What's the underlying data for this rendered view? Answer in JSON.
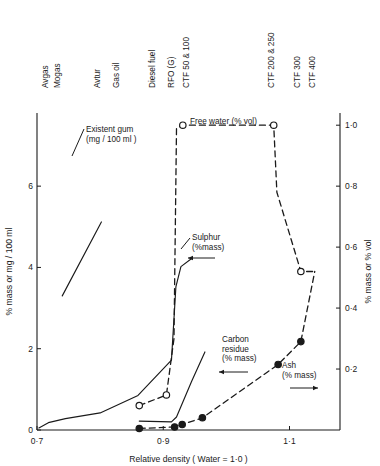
{
  "figure": {
    "title": "",
    "background": "#ffffff",
    "ink": "#1a1a1a"
  },
  "axes": {
    "x": {
      "label": "Relative density  ( Water = 1·0 )",
      "ticks": [
        "0·7",
        "0·9",
        "1·1"
      ],
      "tick_values": [
        0.7,
        0.9,
        1.1
      ],
      "min": 0.7,
      "max": 1.18
    },
    "y_left": {
      "label": "% mass  or  mg / 100 ml",
      "ticks": [
        "0",
        "2",
        "4",
        "6"
      ],
      "tick_values": [
        0,
        2,
        4,
        6
      ],
      "min": 0,
      "max": 7.8
    },
    "y_right": {
      "label": "% mass or % vol",
      "ticks": [
        "0·2",
        "0·4",
        "0·6",
        "0·8",
        "1·0"
      ],
      "tick_values": [
        0.2,
        0.4,
        0.6,
        0.8,
        1.0
      ],
      "min": 0,
      "max": 1.04
    }
  },
  "top_labels": [
    {
      "text": "Avgas",
      "density": 0.717
    },
    {
      "text": "Mogas",
      "density": 0.737
    },
    {
      "text": "Avtur",
      "density": 0.8
    },
    {
      "text": "Gas oil",
      "density": 0.83
    },
    {
      "text": "Diesel fuel",
      "density": 0.887
    },
    {
      "text": "RFO (G)",
      "density": 0.917
    },
    {
      "text": "CTF 50 & 100",
      "density": 0.94
    },
    {
      "text": "CTF 200 & 250",
      "density": 1.075
    },
    {
      "text": "CTF 300",
      "density": 1.116
    },
    {
      "text": "CTF 400",
      "density": 1.14
    }
  ],
  "annotations": [
    {
      "name": "existent-gum",
      "lines": [
        "Existent  gum",
        "(mg / 100 ml )"
      ],
      "arrow": "none"
    },
    {
      "name": "free-water",
      "lines": [
        "Free  water (% vol)"
      ],
      "arrow": "none"
    },
    {
      "name": "sulphur",
      "lines": [
        "Sulphur",
        "(%mass)"
      ],
      "arrow": "left"
    },
    {
      "name": "carbon-residue",
      "lines": [
        "Carbon",
        "residue",
        "(% mass)"
      ],
      "arrow": "left"
    },
    {
      "name": "ash",
      "lines": [
        "Ash",
        "(% mass)"
      ],
      "arrow": "right"
    }
  ],
  "chart_data": {
    "type": "line",
    "title": "",
    "xlabel": "Relative density  ( Water = 1·0 )",
    "ylabel": "% mass  or  mg / 100 ml",
    "ylabel_right": "% mass or % vol",
    "xlim": [
      0.7,
      1.18
    ],
    "ylim_left": [
      0,
      7.8
    ],
    "ylim_right": [
      0,
      1.04
    ],
    "grid": false,
    "legend": "inline-annotations",
    "series": [
      {
        "name": "Existent gum (mg/100 ml)",
        "axis": "left",
        "style": "solid",
        "marker": "none",
        "points": [
          {
            "x": 0.74,
            "y": 3.3
          },
          {
            "x": 0.8,
            "y": 5.1
          },
          {
            "x": 0.79,
            "y": 4.85
          }
        ],
        "points_full": [
          {
            "x": 0.74,
            "y": 3.3
          },
          {
            "x": 0.802,
            "y": 5.12
          }
        ]
      },
      {
        "name": "Sulphur (% mass)",
        "axis": "left",
        "style": "solid",
        "marker": "none",
        "points": [
          {
            "x": 0.703,
            "y": 0.05
          },
          {
            "x": 0.718,
            "y": 0.18
          },
          {
            "x": 0.745,
            "y": 0.28
          },
          {
            "x": 0.8,
            "y": 0.42
          },
          {
            "x": 0.86,
            "y": 0.85
          },
          {
            "x": 0.913,
            "y": 1.72
          },
          {
            "x": 0.92,
            "y": 3.52
          },
          {
            "x": 0.928,
            "y": 4.02
          },
          {
            "x": 0.945,
            "y": 4.22
          }
        ]
      },
      {
        "name": "Carbon residue (% mass)",
        "axis": "left",
        "style": "solid",
        "marker": "none",
        "points": [
          {
            "x": 0.862,
            "y": 0.22
          },
          {
            "x": 0.913,
            "y": 0.2
          },
          {
            "x": 0.921,
            "y": 0.32
          },
          {
            "x": 0.945,
            "y": 1.2
          },
          {
            "x": 0.966,
            "y": 1.92
          }
        ]
      },
      {
        "name": "Free water (% vol)",
        "axis": "right",
        "style": "dashed",
        "marker": "open-circle",
        "points": [
          {
            "x": 0.862,
            "y": 0.08
          },
          {
            "x": 0.905,
            "y": 0.115
          },
          {
            "x": 0.917,
            "y": 0.3
          },
          {
            "x": 0.921,
            "y": 0.99
          },
          {
            "x": 0.931,
            "y": 1.0
          },
          {
            "x": 1.075,
            "y": 1.0
          },
          {
            "x": 1.08,
            "y": 0.78
          },
          {
            "x": 1.118,
            "y": 0.52
          },
          {
            "x": 1.14,
            "y": 0.52
          }
        ],
        "markers_at": [
          {
            "x": 0.862,
            "y": 0.08
          },
          {
            "x": 0.905,
            "y": 0.115
          },
          {
            "x": 0.931,
            "y": 1.0
          },
          {
            "x": 1.075,
            "y": 1.0
          },
          {
            "x": 1.118,
            "y": 0.52
          }
        ]
      },
      {
        "name": "Ash (% mass)",
        "axis": "right",
        "style": "dashed",
        "marker": "filled-circle",
        "points": [
          {
            "x": 0.862,
            "y": 0.005
          },
          {
            "x": 0.918,
            "y": 0.01
          },
          {
            "x": 0.93,
            "y": 0.018
          },
          {
            "x": 0.962,
            "y": 0.04
          },
          {
            "x": 1.082,
            "y": 0.215
          },
          {
            "x": 1.118,
            "y": 0.29
          },
          {
            "x": 1.14,
            "y": 0.52
          }
        ],
        "markers_at": [
          {
            "x": 0.862,
            "y": 0.005
          },
          {
            "x": 0.918,
            "y": 0.01
          },
          {
            "x": 0.93,
            "y": 0.018
          },
          {
            "x": 0.962,
            "y": 0.04
          },
          {
            "x": 1.082,
            "y": 0.215
          },
          {
            "x": 1.118,
            "y": 0.29
          }
        ]
      }
    ]
  }
}
